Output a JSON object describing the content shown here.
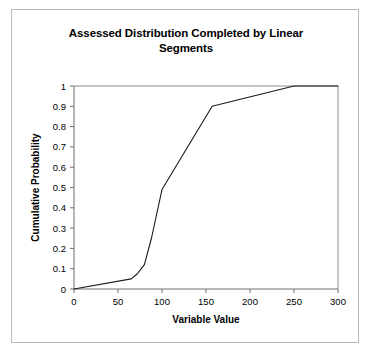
{
  "figure": {
    "title": "Assessed Distribution Completed by Linear Segments",
    "background_color": "#ffffff",
    "frame_color": "#b8b8b8",
    "line_color": "#1a1a1a",
    "axis_color": "#808080"
  },
  "chart_data": {
    "type": "line",
    "title": "Assessed Distribution Completed by Linear Segments",
    "xlabel": "Variable Value",
    "ylabel": "Cumulative Probability",
    "xlim": [
      0,
      300
    ],
    "ylim": [
      0,
      1
    ],
    "xticks": [
      0,
      50,
      100,
      150,
      200,
      250,
      300
    ],
    "xtick_labels": [
      "0",
      "50",
      "100",
      "150",
      "200",
      "250",
      "300"
    ],
    "yticks": [
      0,
      0.1,
      0.2,
      0.3,
      0.4,
      0.5,
      0.6,
      0.7,
      0.8,
      0.9,
      1
    ],
    "ytick_labels": [
      "0",
      "0.1",
      "0.2",
      "0.3",
      "0.4",
      "0.5",
      "0.6",
      "0.7",
      "0.8",
      "0.9",
      "1"
    ],
    "grid": false,
    "legend": false,
    "series": [
      {
        "name": "Assessed cumulative distribution",
        "x": [
          0,
          65,
          72,
          80,
          88,
          100,
          157,
          250,
          300
        ],
        "y": [
          0,
          0.05,
          0.075,
          0.12,
          0.25,
          0.49,
          0.9,
          1.0,
          1.0
        ]
      }
    ]
  }
}
